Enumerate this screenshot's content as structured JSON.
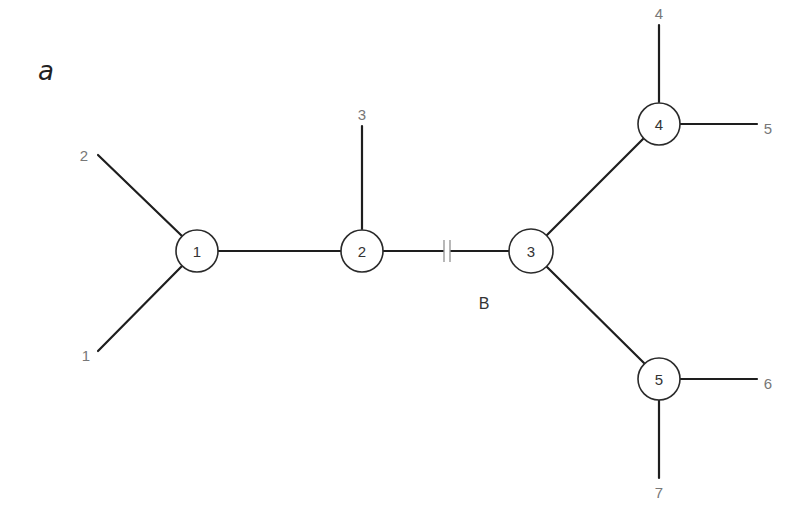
{
  "panel_label": "a",
  "branch_label": "B",
  "colors": {
    "edge": "#1e1e1e",
    "node_stroke": "#2a2a2a",
    "leaf_text": "#777777",
    "node_text": "#333333"
  },
  "internal_nodes": [
    {
      "id": "1",
      "label": "1",
      "x": 197,
      "y": 250
    },
    {
      "id": "2",
      "label": "2",
      "x": 362,
      "y": 250
    },
    {
      "id": "3",
      "label": "3",
      "x": 531,
      "y": 250
    },
    {
      "id": "4",
      "label": "4",
      "x": 659,
      "y": 123
    },
    {
      "id": "5",
      "label": "5",
      "x": 659,
      "y": 378
    }
  ],
  "leaves": [
    {
      "label": "1",
      "x": 85,
      "y": 356
    },
    {
      "label": "2",
      "x": 85,
      "y": 155
    },
    {
      "label": "3",
      "x": 362,
      "y": 115
    },
    {
      "label": "4",
      "x": 659,
      "y": 14
    },
    {
      "label": "5",
      "x": 768,
      "y": 129
    },
    {
      "label": "6",
      "x": 768,
      "y": 384
    },
    {
      "label": "7",
      "x": 659,
      "y": 490
    }
  ],
  "edges": [
    {
      "from": "node-1",
      "to": "leaf-1"
    },
    {
      "from": "node-1",
      "to": "leaf-2"
    },
    {
      "from": "node-1",
      "to": "node-2"
    },
    {
      "from": "node-2",
      "to": "leaf-3"
    },
    {
      "from": "node-2",
      "to": "node-3",
      "broken": true,
      "label": "B"
    },
    {
      "from": "node-3",
      "to": "node-4"
    },
    {
      "from": "node-3",
      "to": "node-5"
    },
    {
      "from": "node-4",
      "to": "leaf-4"
    },
    {
      "from": "node-4",
      "to": "leaf-5"
    },
    {
      "from": "node-5",
      "to": "leaf-6"
    },
    {
      "from": "node-5",
      "to": "leaf-7"
    }
  ]
}
